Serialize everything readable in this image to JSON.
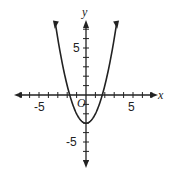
{
  "chart_data": {
    "type": "line",
    "title": "",
    "function": "y = x^2 - 3",
    "xlabel": "x",
    "ylabel": "y",
    "origin_label": "O",
    "xlim": [
      -9,
      9
    ],
    "ylim": [
      -8,
      8
    ],
    "x_tick_labels": [
      "-5",
      "5"
    ],
    "y_tick_labels": [
      "5",
      "-5"
    ],
    "tick_step": 1,
    "grid": false,
    "vertex": [
      0,
      -3
    ],
    "x_intercepts": [
      -1.73,
      1.73
    ],
    "series": [
      {
        "name": "parabola",
        "x": [
          -3.3,
          -3,
          -2,
          -1.73,
          -1,
          0,
          1,
          1.73,
          2,
          3,
          3.3
        ],
        "y": [
          7.89,
          6,
          1,
          0,
          -2,
          -3,
          -2,
          0,
          1,
          6,
          7.89
        ]
      }
    ]
  }
}
